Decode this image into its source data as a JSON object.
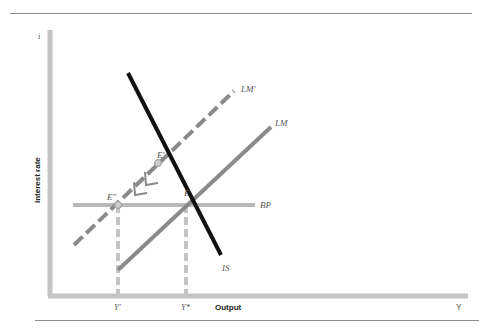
{
  "figure": {
    "y_axis_label": "Interest rate",
    "y_axis_symbol": "i",
    "x_axis_label": "Output",
    "x_axis_symbol": "Y",
    "curves": {
      "is": "IS",
      "lm": "LM",
      "lm_shifted": "LM'",
      "bp": "BP"
    },
    "points": {
      "e": "E",
      "e_prime": "E'",
      "e_double_prime": "E\""
    },
    "x_ticks": {
      "y_prime": "Y'",
      "y_star": "Y*"
    },
    "colors": {
      "is_line": "#111111",
      "lm_line": "#8a8a8a",
      "lm_shifted_line": "#8a8a8a",
      "bp_line": "#b8b8b8",
      "axis": "#c4c4c4",
      "guide": "#c4c4c4"
    }
  }
}
